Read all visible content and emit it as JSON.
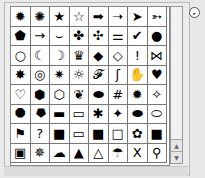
{
  "panel": {
    "title": "Custom Shape Picker",
    "flyout_icon": "▸",
    "scrollbar": {
      "up_icon": "▲",
      "down_icon": "▼"
    }
  },
  "shapes": [
    {
      "name": "burst-8",
      "glyph": "✹"
    },
    {
      "name": "burst-outline",
      "glyph": "✺"
    },
    {
      "name": "star-filled",
      "glyph": "★"
    },
    {
      "name": "star-outline",
      "glyph": "☆"
    },
    {
      "name": "arrow-right-heavy",
      "glyph": "➡"
    },
    {
      "name": "arrow-right-thin",
      "glyph": "➝"
    },
    {
      "name": "arrowhead-right",
      "glyph": "➤"
    },
    {
      "name": "arrow-feathered",
      "glyph": "➳"
    },
    {
      "name": "arrow-pentagon",
      "glyph": "⬟"
    },
    {
      "name": "arrow-right",
      "glyph": "→"
    },
    {
      "name": "banner-curved",
      "glyph": "⌣"
    },
    {
      "name": "puzzle-filled",
      "glyph": "✤"
    },
    {
      "name": "puzzle-outline",
      "glyph": "✣"
    },
    {
      "name": "bone",
      "glyph": "⚌"
    },
    {
      "name": "checkmark",
      "glyph": "✔"
    },
    {
      "name": "circle-filled",
      "glyph": "●"
    },
    {
      "name": "ring",
      "glyph": "○"
    },
    {
      "name": "moon-filled",
      "glyph": "☾"
    },
    {
      "name": "moon-outline",
      "glyph": "☽"
    },
    {
      "name": "crown",
      "glyph": "♛"
    },
    {
      "name": "diamond-filled",
      "glyph": "◆"
    },
    {
      "name": "diamond-outline",
      "glyph": "◇"
    },
    {
      "name": "exclamation",
      "glyph": "!"
    },
    {
      "name": "fish",
      "glyph": "⋈"
    },
    {
      "name": "seal-filled",
      "glyph": "✸"
    },
    {
      "name": "seal-ring",
      "glyph": "◎"
    },
    {
      "name": "sun-burst",
      "glyph": "✷"
    },
    {
      "name": "sun-outline",
      "glyph": "☼"
    },
    {
      "name": "footprint-left",
      "glyph": "𝓕"
    },
    {
      "name": "footprint-right",
      "glyph": "ʃ"
    },
    {
      "name": "hand",
      "glyph": "✋"
    },
    {
      "name": "heart-filled",
      "glyph": "♥"
    },
    {
      "name": "heart-outline",
      "glyph": "♡"
    },
    {
      "name": "hexagon-filled",
      "glyph": "⬢"
    },
    {
      "name": "hexagon-outline",
      "glyph": "⬡"
    },
    {
      "name": "leaf",
      "glyph": "❦"
    },
    {
      "name": "lips",
      "glyph": "⬬"
    },
    {
      "name": "hash",
      "glyph": "#"
    },
    {
      "name": "octagon-burst",
      "glyph": "✹"
    },
    {
      "name": "star-octagon-outline",
      "glyph": "✧"
    },
    {
      "name": "octagon-filled",
      "glyph": "⯃"
    },
    {
      "name": "octagon-outline",
      "glyph": "⯂"
    },
    {
      "name": "frame-filled",
      "glyph": "▬"
    },
    {
      "name": "frame-outline",
      "glyph": "▭"
    },
    {
      "name": "asterisk-star",
      "glyph": "✱"
    },
    {
      "name": "maple-leaf",
      "glyph": "✦"
    },
    {
      "name": "ellipse-filled",
      "glyph": "⬬"
    },
    {
      "name": "ellipse-outline",
      "glyph": "⬭"
    },
    {
      "name": "flag",
      "glyph": "⚑"
    },
    {
      "name": "question",
      "glyph": "?"
    },
    {
      "name": "rect-filled",
      "glyph": "■"
    },
    {
      "name": "rect-outline",
      "glyph": "▭"
    },
    {
      "name": "square-filled",
      "glyph": "■"
    },
    {
      "name": "square-outline",
      "glyph": "□"
    },
    {
      "name": "shamrock",
      "glyph": "✿"
    },
    {
      "name": "square-filled-2",
      "glyph": "■"
    },
    {
      "name": "square-frame",
      "glyph": "▣"
    },
    {
      "name": "spike-burst",
      "glyph": "✵"
    },
    {
      "name": "cloud-badge",
      "glyph": "☁"
    },
    {
      "name": "triangle-filled",
      "glyph": "▲"
    },
    {
      "name": "triangle-outline",
      "glyph": "△"
    },
    {
      "name": "umbrella",
      "glyph": "☂"
    },
    {
      "name": "x-mark",
      "glyph": "X"
    },
    {
      "name": "keyhole",
      "glyph": "⚲"
    }
  ]
}
